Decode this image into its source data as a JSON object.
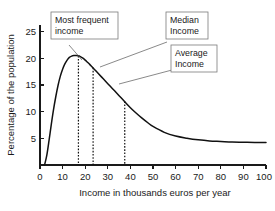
{
  "chart_data": {
    "type": "line",
    "title": "",
    "xlabel": "Income in thousands euros per year",
    "ylabel": "Percentage of the population",
    "xlim": [
      0,
      100
    ],
    "ylim": [
      0,
      26
    ],
    "xticks": [
      0,
      10,
      20,
      30,
      40,
      50,
      60,
      70,
      80,
      90,
      100
    ],
    "yticks": [
      5,
      10,
      15,
      20,
      25
    ],
    "grid": false,
    "legend": "none",
    "series": [
      {
        "name": "Income distribution",
        "x": [
          2,
          3,
          4,
          5,
          6,
          7,
          8,
          9,
          10,
          11,
          12,
          13,
          14,
          15,
          16,
          17,
          18,
          19,
          20,
          21,
          22,
          23,
          24,
          25,
          26,
          28,
          30,
          32,
          34,
          36,
          38,
          40,
          42,
          45,
          48,
          50,
          55,
          60,
          65,
          70,
          75,
          80,
          85,
          90,
          95,
          100
        ],
        "y": [
          0.0,
          1.8,
          4.6,
          7.6,
          10.4,
          12.8,
          14.9,
          16.6,
          17.9,
          18.9,
          19.6,
          20.1,
          20.35,
          20.45,
          20.45,
          20.4,
          20.2,
          19.95,
          19.6,
          19.2,
          18.8,
          18.35,
          17.9,
          17.45,
          17.0,
          16.1,
          15.2,
          14.3,
          13.4,
          12.5,
          11.6,
          10.7,
          9.9,
          8.8,
          7.8,
          7.2,
          6.1,
          5.4,
          5.0,
          4.7,
          4.5,
          4.4,
          4.3,
          4.25,
          4.2,
          4.2
        ]
      }
    ],
    "markers": [
      {
        "id": "mode",
        "label": "Most frequent income",
        "x": 17.0,
        "y_top": 20.4
      },
      {
        "id": "median",
        "label": "Median Income",
        "x": 23.5,
        "y_top": 18.2
      },
      {
        "id": "mean",
        "label": "Average Income",
        "x": 37.5,
        "y_top": 11.9
      }
    ],
    "annotations": [
      {
        "id": "mode",
        "lines": [
          "Most frequent",
          "income"
        ]
      },
      {
        "id": "median",
        "lines": [
          "Median",
          "Income"
        ]
      },
      {
        "id": "mean",
        "lines": [
          "Average",
          "Income"
        ]
      }
    ]
  },
  "axes": {
    "x_title": "Income in thousands euros per year",
    "y_title": "Percentage of the population",
    "x_tick_labels": [
      "0",
      "10",
      "20",
      "30",
      "40",
      "50",
      "60",
      "70",
      "80",
      "90",
      "100"
    ],
    "y_tick_labels": [
      "5",
      "10",
      "15",
      "20",
      "25"
    ]
  },
  "callouts": {
    "mode": {
      "line1": "Most frequent",
      "line2": "income"
    },
    "median": {
      "line1": "Median",
      "line2": "Income"
    },
    "mean": {
      "line1": "Average",
      "line2": "Income"
    }
  },
  "colors": {
    "curve": "#111111",
    "axis": "#1a1a1a",
    "marker": "#111111",
    "box_border": "#7a7a7a",
    "leader": "#6b6b6b",
    "background": "#ffffff"
  }
}
